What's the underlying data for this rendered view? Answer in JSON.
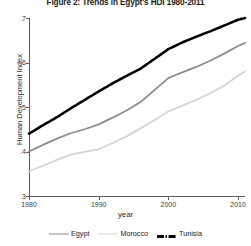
{
  "chart_data": {
    "type": "line",
    "title": "Figure 2: Trends in Egypt's HDI 1980-2011",
    "xlabel": "year",
    "ylabel": "Human Development Index",
    "xlim": [
      1980,
      2011
    ],
    "ylim": [
      0.3,
      0.7
    ],
    "grid": false,
    "legend_position": "bottom",
    "x_ticks": [
      1980,
      1990,
      2000,
      2010
    ],
    "x_tick_labels": [
      "1980",
      "1990",
      "2000",
      "2010"
    ],
    "y_ticks": [
      0.3,
      0.4,
      0.5,
      0.6,
      0.7
    ],
    "y_tick_labels": [
      ".3",
      ".4",
      ".5",
      ".6",
      ".7"
    ],
    "x": [
      1980,
      1982,
      1984,
      1986,
      1988,
      1990,
      1992,
      1994,
      1996,
      1998,
      2000,
      2002,
      2004,
      2006,
      2008,
      2010,
      2011
    ],
    "series": [
      {
        "name": "Egypt",
        "color": "#8c8c8c",
        "style": "solid",
        "values": [
          0.4,
          0.415,
          0.429,
          0.441,
          0.45,
          0.461,
          0.476,
          0.492,
          0.511,
          0.538,
          0.565,
          0.578,
          0.59,
          0.604,
          0.62,
          0.637,
          0.644
        ]
      },
      {
        "name": "Morocco",
        "color": "#d4d4d4",
        "style": "solid",
        "values": [
          0.355,
          0.368,
          0.381,
          0.393,
          0.399,
          0.405,
          0.419,
          0.434,
          0.452,
          0.471,
          0.49,
          0.503,
          0.516,
          0.531,
          0.548,
          0.57,
          0.58
        ]
      },
      {
        "name": "Tunisia",
        "color": "#000000",
        "style": "dash-dot",
        "values": [
          0.44,
          0.459,
          0.477,
          0.497,
          0.516,
          0.535,
          0.553,
          0.57,
          0.586,
          0.608,
          0.63,
          0.645,
          0.658,
          0.67,
          0.683,
          0.696,
          0.7
        ]
      }
    ]
  },
  "legend": {
    "items": [
      {
        "label": "Egypt"
      },
      {
        "label": "Morocco"
      },
      {
        "label": "Tunisia"
      }
    ]
  }
}
